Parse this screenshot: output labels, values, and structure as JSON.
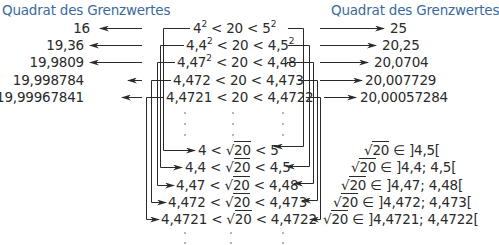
{
  "titles": {
    "left": "Quadrat des Grenzwertes",
    "right": "Quadrat des Grenzwertes"
  },
  "left_squares": [
    "16",
    "19,36",
    "19,9809",
    "19,998784",
    "19,99967841"
  ],
  "right_squares": [
    "25",
    "20,25",
    "20,0704",
    "20,007729",
    "20,00057284"
  ],
  "upper_inequalities": [
    {
      "low": "4",
      "low_exp": "2",
      "mid": "< 20 <",
      "high": "5",
      "high_exp": "2"
    },
    {
      "low": "4,4",
      "low_exp": "2",
      "mid": "< 20 <",
      "high": "4,5",
      "high_exp": "2"
    },
    {
      "low": "4,47",
      "low_exp": "2",
      "mid": "< 20 <",
      "high": "4,48",
      "high_exp": ""
    },
    {
      "low": "4,472",
      "low_exp": "",
      "mid": "< 20 <",
      "high": "4,473",
      "high_exp": ""
    },
    {
      "low": "4,4721",
      "low_exp": "",
      "mid": "< 20 <",
      "high": "4,4722",
      "high_exp": ""
    }
  ],
  "lower_inequalities": [
    {
      "low": "4",
      "lt": "<",
      "radicand": "20",
      "high": "5"
    },
    {
      "low": "4,4",
      "lt": "<",
      "radicand": "20",
      "high": "4,5"
    },
    {
      "low": "4,47",
      "lt": "<",
      "radicand": "20",
      "high": "4,48"
    },
    {
      "low": "4,472",
      "lt": "<",
      "radicand": "20",
      "high": "4,473"
    },
    {
      "low": "4,4721",
      "lt": "<",
      "radicand": "20",
      "high": "4,4722"
    }
  ],
  "intervals": [
    {
      "radicand": "20",
      "text": "∈ ]4,5["
    },
    {
      "radicand": "20",
      "text": "∈ ]4,4; 4,5["
    },
    {
      "radicand": "20",
      "text": "∈ ]4,47; 4,48["
    },
    {
      "radicand": "20",
      "text": "∈ ]4,472; 4,473["
    },
    {
      "radicand": "20",
      "text": "∈ ]4,4721; 4,4722["
    }
  ],
  "ellipsis": "·",
  "colors": {
    "title": "#3b6a9c",
    "line": "#2a2a2a"
  }
}
